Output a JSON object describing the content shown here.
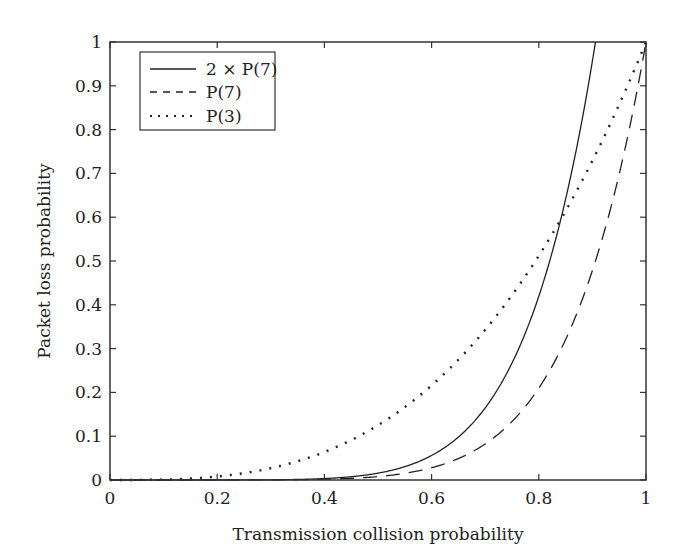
{
  "chart_data": {
    "type": "line",
    "title": "",
    "xlabel": "Transmission collision probability",
    "ylabel": "Packet loss probability",
    "xlim": [
      0,
      1
    ],
    "ylim": [
      0,
      1
    ],
    "grid": false,
    "legend_position": "upper left",
    "x_ticks": [
      "0",
      "0.2",
      "0.4",
      "0.6",
      "0.8",
      "1"
    ],
    "y_ticks": [
      "0",
      "0.1",
      "0.2",
      "0.3",
      "0.4",
      "0.5",
      "0.6",
      "0.7",
      "0.8",
      "0.9",
      "1"
    ],
    "x": [
      0,
      0.1,
      0.2,
      0.3,
      0.4,
      0.5,
      0.6,
      0.7,
      0.8,
      0.85,
      0.9,
      0.906,
      0.95,
      1.0
    ],
    "series": [
      {
        "name": "2 × P(7)",
        "style": "solid",
        "formula": "2*x^7",
        "values": [
          0,
          0.0,
          0.0,
          0.0004,
          0.0033,
          0.0156,
          0.056,
          0.165,
          0.419,
          0.641,
          0.957,
          1.0,
          null,
          null
        ]
      },
      {
        "name": "P(7)",
        "style": "dashed",
        "formula": "x^7",
        "values": [
          0,
          0.0,
          0.0,
          0.0002,
          0.0016,
          0.0078,
          0.028,
          0.082,
          0.21,
          0.321,
          0.478,
          0.5,
          0.698,
          1.0
        ]
      },
      {
        "name": "P(3)",
        "style": "dotted",
        "formula": "x^3",
        "values": [
          0,
          0.001,
          0.008,
          0.027,
          0.064,
          0.125,
          0.216,
          0.343,
          0.512,
          0.614,
          0.729,
          0.744,
          0.857,
          1.0
        ]
      }
    ]
  },
  "legend": {
    "items": [
      {
        "label": "2 × P(7)",
        "style": "solid"
      },
      {
        "label": "P(7)",
        "style": "dashed"
      },
      {
        "label": "P(3)",
        "style": "dotted"
      }
    ]
  }
}
